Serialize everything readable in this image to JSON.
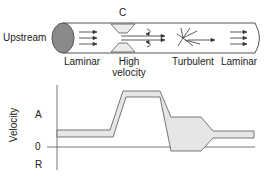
{
  "diagram": {
    "tube": {
      "upstream_label": "Upstream",
      "constriction_label": "C",
      "regions": [
        {
          "id": "laminar-1",
          "label": "Laminar"
        },
        {
          "id": "high-velocity",
          "label_line1": "High",
          "label_line2": "velocity"
        },
        {
          "id": "turbulent",
          "label": "Turbulent"
        },
        {
          "id": "laminar-2",
          "label": "Laminar"
        }
      ]
    },
    "graph": {
      "y_axis_label": "Velocity",
      "y_ticks": [
        "A",
        "0",
        "R"
      ]
    },
    "colors": {
      "stroke": "#555555",
      "band_fill": "#e6e6e6",
      "ellipse_fill": "#8a8a8a",
      "text": "#222222"
    }
  }
}
